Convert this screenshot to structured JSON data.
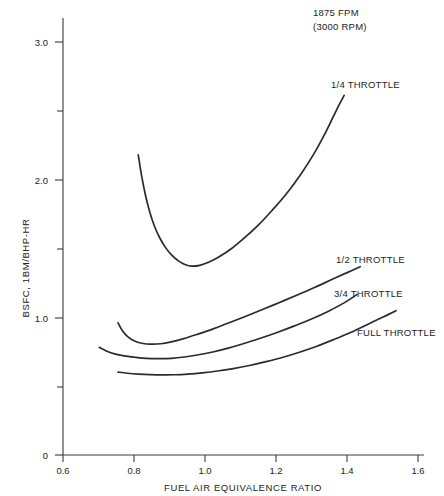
{
  "chart_data": {
    "type": "line",
    "title": "",
    "xlabel": "FUEL AIR EQUIVALENCE RATIO",
    "ylabel": "BSFC, 1BM/BHP-HR",
    "xlim": [
      0.6,
      1.6
    ],
    "ylim": [
      0,
      3.25
    ],
    "xticks": [
      "0.6",
      "0.8",
      "1.0",
      "1.2",
      "1.4",
      "1.6"
    ],
    "xtick_values": [
      0.6,
      0.8,
      1.0,
      1.2,
      1.4,
      1.6
    ],
    "yticks": [
      "0",
      "",
      "1.0",
      "",
      "2.0",
      "",
      "3.0"
    ],
    "ytick_values": [
      0,
      0.5,
      1.0,
      1.5,
      2.0,
      2.5,
      3.0
    ],
    "ytick_labeled": [
      "0",
      "1.0",
      "2.0",
      "3.0"
    ],
    "grid": false,
    "legend": "inline-labels-right",
    "annotations": [
      {
        "name": "speed-annotation-line1",
        "text": "1875 FPM"
      },
      {
        "name": "speed-annotation-line2",
        "text": "(3000 RPM)"
      }
    ],
    "series": [
      {
        "name": "1/4 THROTTLE",
        "label": "1/4 THROTTLE",
        "points": [
          [
            0.812,
            2.18
          ],
          [
            0.822,
            2.02
          ],
          [
            0.833,
            1.88
          ],
          [
            0.845,
            1.76
          ],
          [
            0.858,
            1.66
          ],
          [
            0.872,
            1.58
          ],
          [
            0.888,
            1.51
          ],
          [
            0.905,
            1.455
          ],
          [
            0.925,
            1.41
          ],
          [
            0.945,
            1.382
          ],
          [
            0.963,
            1.372
          ],
          [
            0.985,
            1.378
          ],
          [
            1.01,
            1.4
          ],
          [
            1.04,
            1.44
          ],
          [
            1.075,
            1.5
          ],
          [
            1.11,
            1.575
          ],
          [
            1.15,
            1.67
          ],
          [
            1.19,
            1.78
          ],
          [
            1.23,
            1.9
          ],
          [
            1.27,
            2.04
          ],
          [
            1.305,
            2.18
          ],
          [
            1.335,
            2.32
          ],
          [
            1.36,
            2.45
          ],
          [
            1.378,
            2.545
          ],
          [
            1.392,
            2.612
          ]
        ]
      },
      {
        "name": "1/2 THROTTLE",
        "label": "1/2 THROTTLE",
        "points": [
          [
            0.755,
            0.96
          ],
          [
            0.768,
            0.9
          ],
          [
            0.782,
            0.86
          ],
          [
            0.8,
            0.83
          ],
          [
            0.822,
            0.812
          ],
          [
            0.848,
            0.805
          ],
          [
            0.875,
            0.808
          ],
          [
            0.905,
            0.822
          ],
          [
            0.94,
            0.845
          ],
          [
            0.98,
            0.878
          ],
          [
            1.025,
            0.918
          ],
          [
            1.07,
            0.962
          ],
          [
            1.115,
            1.008
          ],
          [
            1.16,
            1.055
          ],
          [
            1.21,
            1.108
          ],
          [
            1.26,
            1.162
          ],
          [
            1.31,
            1.218
          ],
          [
            1.36,
            1.278
          ],
          [
            1.405,
            1.33
          ],
          [
            1.437,
            1.368
          ]
        ]
      },
      {
        "name": "3/4 THROTTLE",
        "label": "3/4 THROTTLE",
        "points": [
          [
            0.702,
            0.782
          ],
          [
            0.722,
            0.755
          ],
          [
            0.745,
            0.735
          ],
          [
            0.772,
            0.72
          ],
          [
            0.802,
            0.71
          ],
          [
            0.835,
            0.702
          ],
          [
            0.87,
            0.7
          ],
          [
            0.905,
            0.702
          ],
          [
            0.942,
            0.712
          ],
          [
            0.982,
            0.728
          ],
          [
            1.025,
            0.75
          ],
          [
            1.068,
            0.778
          ],
          [
            1.112,
            0.812
          ],
          [
            1.158,
            0.85
          ],
          [
            1.205,
            0.892
          ],
          [
            1.252,
            0.938
          ],
          [
            1.3,
            0.988
          ],
          [
            1.348,
            1.045
          ],
          [
            1.392,
            1.105
          ],
          [
            1.428,
            1.165
          ]
        ]
      },
      {
        "name": "FULL THROTTLE",
        "label": "FULL THROTTLE",
        "points": [
          [
            0.755,
            0.602
          ],
          [
            0.782,
            0.594
          ],
          [
            0.812,
            0.588
          ],
          [
            0.845,
            0.584
          ],
          [
            0.88,
            0.582
          ],
          [
            0.915,
            0.583
          ],
          [
            0.952,
            0.588
          ],
          [
            0.992,
            0.597
          ],
          [
            1.035,
            0.61
          ],
          [
            1.08,
            0.628
          ],
          [
            1.125,
            0.65
          ],
          [
            1.172,
            0.678
          ],
          [
            1.22,
            0.71
          ],
          [
            1.268,
            0.748
          ],
          [
            1.315,
            0.79
          ],
          [
            1.362,
            0.838
          ],
          [
            1.41,
            0.89
          ],
          [
            1.455,
            0.945
          ],
          [
            1.5,
            1.0
          ],
          [
            1.538,
            1.048
          ]
        ]
      }
    ]
  },
  "axes": {
    "y_title": "BSFC, 1BM/BHP-HR",
    "x_title": "FUEL AIR EQUIVALENCE RATIO",
    "y_tick_labels": {
      "t0": "0",
      "t1_0": "1.0",
      "t2_0": "2.0",
      "t3_0": "3.0"
    },
    "x_tick_labels": {
      "t0_6": "0.6",
      "t0_8": "0.8",
      "t1_0": "1.0",
      "t1_2": "1.2",
      "t1_4": "1.4",
      "t1_6": "1.6"
    }
  },
  "annotations": {
    "fpm": "1875 FPM",
    "rpm": "(3000 RPM)"
  },
  "curve_labels": {
    "quarter": "1/4 THROTTLE",
    "half": "1/2 THROTTLE",
    "three_quarter": "3/4 THROTTLE",
    "full": "FULL THROTTLE"
  },
  "colors": {
    "curve": "#2b2b2b",
    "axis": "#3a3a3a",
    "text": "#232323",
    "background": "#ffffff"
  }
}
